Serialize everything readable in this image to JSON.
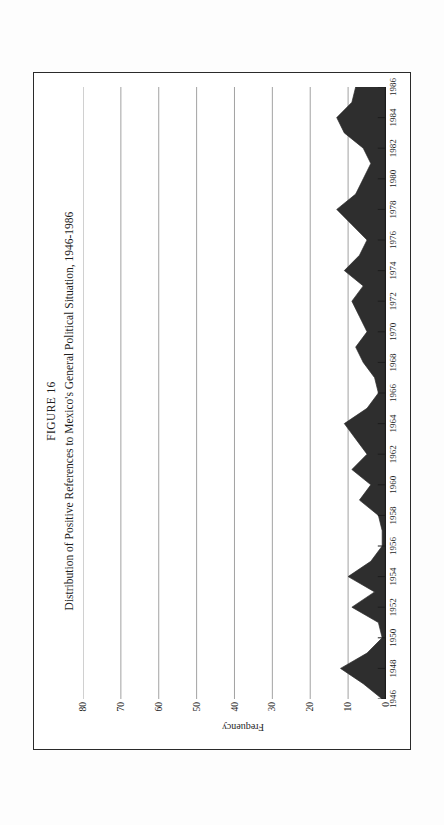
{
  "figure": {
    "number_label": "FIGURE 16",
    "title": "Distribution of Positive References to Mexico's General Political Situation, 1946-1986"
  },
  "chart_data": {
    "type": "area",
    "title": "Distribution of Positive References to Mexico's General Political Situation, 1946-1986",
    "subtitle": "FIGURE 16",
    "xlabel": "",
    "ylabel": "Frequency",
    "ylim": [
      0,
      80
    ],
    "xlim": [
      1946,
      1986
    ],
    "grid": true,
    "grid_axis": "y",
    "legend": false,
    "fill_color": "#2e2e2e",
    "yticks": [
      0,
      10,
      20,
      30,
      40,
      50,
      60,
      70,
      80
    ],
    "ytick_labels": [
      "0",
      "10",
      "20",
      "30",
      "40",
      "50",
      "60",
      "70",
      "80"
    ],
    "xticks": [
      1946,
      1948,
      1950,
      1952,
      1954,
      1956,
      1958,
      1960,
      1962,
      1964,
      1966,
      1968,
      1970,
      1972,
      1974,
      1976,
      1978,
      1980,
      1982,
      1984,
      1986
    ],
    "xtick_labels": [
      "1946",
      "1948",
      "1950",
      "1952",
      "1954",
      "1956",
      "1958",
      "1960",
      "1962",
      "1964",
      "1966",
      "1968",
      "1970",
      "1972",
      "1974",
      "1976",
      "1978",
      "1980",
      "1982",
      "1984",
      "1986"
    ],
    "x": [
      1946,
      1947,
      1948,
      1949,
      1950,
      1951,
      1952,
      1953,
      1954,
      1955,
      1956,
      1957,
      1958,
      1959,
      1960,
      1961,
      1962,
      1963,
      1964,
      1965,
      1966,
      1967,
      1968,
      1969,
      1970,
      1971,
      1972,
      1973,
      1974,
      1975,
      1976,
      1977,
      1978,
      1979,
      1980,
      1981,
      1982,
      1983,
      1984,
      1985,
      1986
    ],
    "values": [
      1,
      6,
      12,
      5,
      1,
      2,
      9,
      3,
      10,
      4,
      1,
      1,
      2,
      7,
      4,
      9,
      5,
      8,
      11,
      5,
      2,
      3,
      6,
      8,
      5,
      7,
      9,
      6,
      11,
      7,
      5,
      9,
      13,
      8,
      6,
      4,
      6,
      11,
      13,
      9,
      8
    ]
  }
}
